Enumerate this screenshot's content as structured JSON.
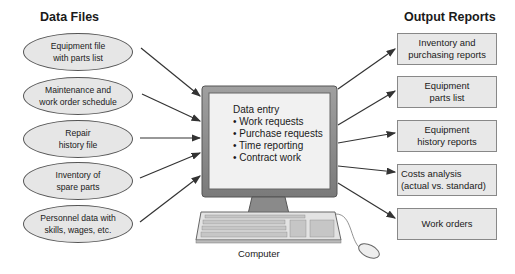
{
  "headings": {
    "data_files": "Data Files",
    "output_reports": "Output Reports"
  },
  "data_files": [
    {
      "line1": "Equipment file",
      "line2": "with parts list"
    },
    {
      "line1": "Maintenance and",
      "line2": "work order schedule"
    },
    {
      "line1": "Repair",
      "line2": "history file"
    },
    {
      "line1": "Inventory of",
      "line2": "spare parts"
    },
    {
      "line1": "Personnel data with",
      "line2": "skills, wages, etc."
    }
  ],
  "computer": {
    "screen_title": "Data entry",
    "items": [
      "• Work requests",
      "• Purchase requests",
      "• Time reporting",
      "• Contract work"
    ],
    "caption": "Computer"
  },
  "output_reports": [
    {
      "line1": "Inventory and",
      "line2": "purchasing reports"
    },
    {
      "line1": "Equipment",
      "line2": "parts list"
    },
    {
      "line1": "Equipment",
      "line2": "history reports"
    },
    {
      "line1": "Costs analysis",
      "line2": "(actual vs. standard)"
    },
    {
      "line1": "Work orders",
      "line2": ""
    }
  ],
  "colors": {
    "shape_fill": "#e6e6e6",
    "monitor_frame": "#8c8c8c",
    "arrow": "#333333"
  }
}
